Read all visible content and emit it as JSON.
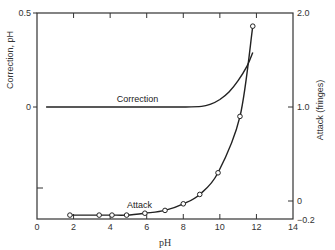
{
  "chart_data": {
    "type": "line",
    "title": "",
    "xlabel": "pH",
    "ylabel_left": "Correction, pH",
    "ylabel_right": "Attack (fringes)",
    "xlim": [
      0,
      14
    ],
    "ylim_left": [
      -0.55,
      0.5
    ],
    "ylim_right": [
      -0.2,
      2.0
    ],
    "x_ticks": [
      0,
      2,
      4,
      6,
      8,
      10,
      12,
      14
    ],
    "x_tick_labels": [
      "0",
      "2",
      "4",
      "6",
      "8",
      "10",
      "12",
      "14"
    ],
    "y_left_tick_labels": [
      {
        "value": 0.5,
        "label": "0.5"
      },
      {
        "value": 0,
        "label": "0"
      }
    ],
    "y_right_tick_labels": [
      {
        "value": 2.0,
        "label": "2.0"
      },
      {
        "value": 1.0,
        "label": "1.0"
      },
      {
        "value": 0,
        "label": "0"
      },
      {
        "value": -0.2,
        "label": "−0.2"
      }
    ],
    "grid": false,
    "legend": "inline labels",
    "series": [
      {
        "name": "Correction",
        "axis": "left",
        "markers": false,
        "x": [
          0.5,
          2,
          4,
          6,
          8,
          9,
          9.5,
          10,
          10.5,
          11,
          11.5,
          11.8
        ],
        "y": [
          0,
          0,
          0,
          0,
          0,
          0.003,
          0.015,
          0.04,
          0.08,
          0.14,
          0.22,
          0.29
        ]
      },
      {
        "name": "Attack",
        "axis": "right",
        "markers": true,
        "x": [
          1.8,
          3.4,
          4.1,
          4.9,
          5.9,
          7.0,
          8.0,
          8.9,
          9.9,
          11.1,
          11.8
        ],
        "y": [
          -0.15,
          -0.15,
          -0.15,
          -0.15,
          -0.13,
          -0.1,
          -0.03,
          0.07,
          0.3,
          0.9,
          1.86
        ]
      }
    ],
    "annotations": [
      {
        "text": "Correction",
        "x": 5.5,
        "y_left": 0.03
      },
      {
        "text": "Attack",
        "x": 5.6,
        "y_right": -0.08
      }
    ]
  }
}
